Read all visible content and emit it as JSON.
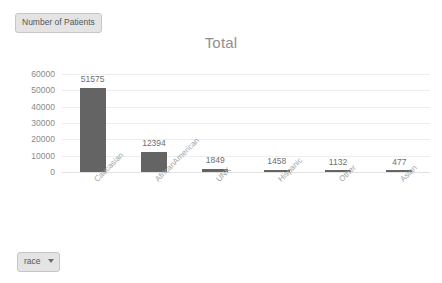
{
  "measure_pill": {
    "label": "Number of Patients",
    "icon": "measure-pill"
  },
  "filter_pill": {
    "label": "race",
    "icon": "chevron-down-icon"
  },
  "colors": {
    "bar": "#646464",
    "gridline": "#ededed",
    "axis_text": "#8a8a8a",
    "title": "#909090",
    "pill_background": "#e4e4e4",
    "pill_border": "#c6c6c6"
  },
  "chart_data": {
    "type": "bar",
    "title": "Total",
    "xlabel": "",
    "ylabel": "",
    "ylim": [
      0,
      60000
    ],
    "yticks": [
      60000,
      50000,
      40000,
      30000,
      20000,
      10000,
      0
    ],
    "ytick_labels": [
      "60000",
      "50000",
      "40000",
      "30000",
      "20000",
      "10000",
      "0"
    ],
    "grid": true,
    "legend": false,
    "categories": [
      "Caucasian",
      "AfricanAmerican",
      "UNK",
      "Hispanic",
      "Other",
      "Asian"
    ],
    "values": [
      51575,
      12394,
      1849,
      1458,
      1132,
      477
    ],
    "value_labels": [
      "51575",
      "12394",
      "1849",
      "1458",
      "1132",
      "477"
    ]
  }
}
